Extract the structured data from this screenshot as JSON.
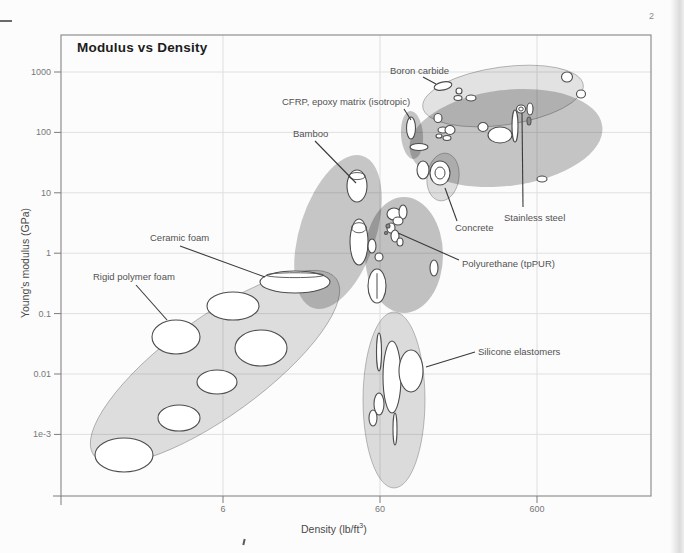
{
  "page": {
    "number": "2"
  },
  "chart_data": {
    "type": "scatter",
    "subtype": "Ashby material property bubble chart",
    "title": "Modulus vs Density",
    "xlabel": "Density (lb/ft3)",
    "xlabel_parts": {
      "prefix": "Density (lb/ft",
      "sup": "3",
      "suffix": ")"
    },
    "ylabel": "Young's modulus (GPa)",
    "x_axis": {
      "scale": "log",
      "ticks": [
        6,
        60,
        600
      ],
      "tick_labels": [
        "6",
        "60",
        "600"
      ],
      "range_approx": [
        0.55,
        3200
      ]
    },
    "y_axis": {
      "scale": "log",
      "ticks": [
        1000,
        100,
        10,
        1,
        0.1,
        0.01,
        0.001
      ],
      "tick_labels": [
        "1000",
        "100",
        "10",
        "1",
        "0.1",
        "0.01",
        "1e-3"
      ],
      "range_approx": [
        0.0001,
        4000
      ]
    },
    "grid": "on",
    "materials_labeled": [
      {
        "label": "Rigid polymer foam",
        "density_lb_ft3": 3,
        "modulus_GPa": 0.04
      },
      {
        "label": "Ceramic foam",
        "density_lb_ft3": 17,
        "modulus_GPa": 0.3
      },
      {
        "label": "Bamboo",
        "density_lb_ft3": 43,
        "modulus_GPa": 13
      },
      {
        "label": "CFRP, epoxy matrix (isotropic)",
        "density_lb_ft3": 95,
        "modulus_GPa": 90
      },
      {
        "label": "Boron carbide",
        "density_lb_ft3": 150,
        "modulus_GPa": 570
      },
      {
        "label": "Concrete",
        "density_lb_ft3": 145,
        "modulus_GPa": 21
      },
      {
        "label": "Stainless steel",
        "density_lb_ft3": 475,
        "modulus_GPa": 240
      },
      {
        "label": "Polyurethane (tpPUR)",
        "density_lb_ft3": 75,
        "modulus_GPa": 3
      },
      {
        "label": "Silicone elastomers",
        "density_lb_ft3": 95,
        "modulus_GPa": 0.011
      }
    ],
    "layout_px": {
      "frame": {
        "left": 61,
        "top": 35,
        "right": 651,
        "bottom": 496
      },
      "x_anchor": {
        "value": 6,
        "px": 223,
        "decade_px": 157
      },
      "y_anchor": {
        "value": 1000,
        "px": 72,
        "decade_px": 60.4
      }
    },
    "regions": [
      {
        "id": "foams-envelope",
        "cx": 215,
        "cy": 367,
        "rx": 150,
        "ry": 49,
        "rot": -36,
        "op": 0.12,
        "outlined": true
      },
      {
        "id": "natural-materials-envelope",
        "cx": 338,
        "cy": 232,
        "rx": 38,
        "ry": 80,
        "rot": 18,
        "op": 0.21,
        "outlined": false
      },
      {
        "id": "polymers-envelope",
        "cx": 404,
        "cy": 255,
        "rx": 39,
        "ry": 58,
        "rot": 0,
        "op": 0.23,
        "outlined": false
      },
      {
        "id": "metals-envelope",
        "cx": 506,
        "cy": 138,
        "rx": 97,
        "ry": 48,
        "rot": -7,
        "op": 0.22,
        "outlined": false
      },
      {
        "id": "ceramics-envelope",
        "cx": 503,
        "cy": 96,
        "rx": 81,
        "ry": 29,
        "rot": -8,
        "op": 0.1,
        "outlined": true
      },
      {
        "id": "composites-envelope",
        "cx": 412,
        "cy": 135,
        "rx": 11,
        "ry": 24,
        "rot": -4,
        "op": 0.22,
        "outlined": false
      },
      {
        "id": "concrete-envelope",
        "cx": 443,
        "cy": 177,
        "rx": 16,
        "ry": 24,
        "rot": 8,
        "op": 0.12,
        "outlined": true
      },
      {
        "id": "elastomers-envelope",
        "cx": 394,
        "cy": 400,
        "rx": 31,
        "ry": 88,
        "rot": 0,
        "op": 0.13,
        "outlined": true
      }
    ],
    "bubbles": [
      {
        "cx": 124,
        "cy": 455,
        "rx": 29,
        "ry": 17
      },
      {
        "cx": 179,
        "cy": 418,
        "rx": 21,
        "ry": 13
      },
      {
        "cx": 217,
        "cy": 382,
        "rx": 20,
        "ry": 12
      },
      {
        "cx": 176,
        "cy": 337,
        "rx": 24,
        "ry": 17
      },
      {
        "cx": 233,
        "cy": 306,
        "rx": 26,
        "ry": 14
      },
      {
        "cx": 261,
        "cy": 348,
        "rx": 26,
        "ry": 18
      },
      {
        "cx": 295,
        "cy": 282,
        "rx": 35,
        "ry": 11,
        "v": "cap"
      },
      {
        "cx": 357,
        "cy": 186,
        "rx": 10,
        "ry": 16,
        "v": "cap"
      },
      {
        "cx": 359,
        "cy": 242,
        "rx": 9,
        "ry": 23,
        "v": "cap"
      },
      {
        "cx": 372,
        "cy": 246,
        "rx": 4,
        "ry": 7
      },
      {
        "cx": 379,
        "cy": 257,
        "rx": 4,
        "ry": 4
      },
      {
        "cx": 377,
        "cy": 286,
        "rx": 9,
        "ry": 17,
        "v": "vline"
      },
      {
        "cx": 394,
        "cy": 214,
        "rx": 7,
        "ry": 6
      },
      {
        "cx": 403,
        "cy": 212,
        "rx": 4,
        "ry": 7
      },
      {
        "cx": 398,
        "cy": 221,
        "rx": 5,
        "ry": 4
      },
      {
        "cx": 391,
        "cy": 228,
        "rx": 4,
        "ry": 5
      },
      {
        "cx": 395,
        "cy": 236,
        "rx": 4,
        "ry": 6
      },
      {
        "cx": 400,
        "cy": 242,
        "rx": 3,
        "ry": 4
      },
      {
        "cx": 388,
        "cy": 226,
        "rx": 2,
        "ry": 2,
        "v": "dark"
      },
      {
        "cx": 386,
        "cy": 233,
        "rx": 1.5,
        "ry": 1.5,
        "v": "dark"
      },
      {
        "cx": 434,
        "cy": 268,
        "rx": 4,
        "ry": 8
      },
      {
        "cx": 419,
        "cy": 147,
        "rx": 9,
        "ry": 3.5
      },
      {
        "cx": 423,
        "cy": 170,
        "rx": 6,
        "ry": 9
      },
      {
        "cx": 440,
        "cy": 173,
        "rx": 10,
        "ry": 12,
        "v": "ring"
      },
      {
        "cx": 443,
        "cy": 86,
        "rx": 9,
        "ry": 4,
        "rot": -12
      },
      {
        "cx": 459,
        "cy": 91,
        "rx": 3,
        "ry": 3
      },
      {
        "cx": 458,
        "cy": 98,
        "rx": 4,
        "ry": 2.5
      },
      {
        "cx": 471,
        "cy": 98,
        "rx": 5,
        "ry": 3
      },
      {
        "cx": 438,
        "cy": 118,
        "rx": 4,
        "ry": 4.5
      },
      {
        "cx": 411,
        "cy": 128,
        "rx": 4.5,
        "ry": 11
      },
      {
        "cx": 443,
        "cy": 130,
        "rx": 5,
        "ry": 3
      },
      {
        "cx": 450,
        "cy": 130,
        "rx": 5,
        "ry": 4.5
      },
      {
        "cx": 439,
        "cy": 136,
        "rx": 3,
        "ry": 2
      },
      {
        "cx": 447,
        "cy": 138,
        "rx": 4,
        "ry": 2.5
      },
      {
        "cx": 483,
        "cy": 127,
        "rx": 5,
        "ry": 4.5
      },
      {
        "cx": 500,
        "cy": 135,
        "rx": 12,
        "ry": 8
      },
      {
        "cx": 515,
        "cy": 126,
        "rx": 3,
        "ry": 16
      },
      {
        "cx": 521,
        "cy": 109,
        "rx": 4.5,
        "ry": 4,
        "v": "ring"
      },
      {
        "cx": 530,
        "cy": 109,
        "rx": 3,
        "ry": 6
      },
      {
        "cx": 529,
        "cy": 121,
        "rx": 2,
        "ry": 4,
        "v": "dark"
      },
      {
        "cx": 542,
        "cy": 179,
        "rx": 5,
        "ry": 3
      },
      {
        "cx": 567,
        "cy": 77,
        "rx": 5.5,
        "ry": 5
      },
      {
        "cx": 581,
        "cy": 94,
        "rx": 4.5,
        "ry": 4
      },
      {
        "cx": 379,
        "cy": 352,
        "rx": 2.5,
        "ry": 19
      },
      {
        "cx": 392,
        "cy": 377,
        "rx": 9,
        "ry": 36
      },
      {
        "cx": 411,
        "cy": 371,
        "rx": 12,
        "ry": 21
      },
      {
        "cx": 379,
        "cy": 404,
        "rx": 5,
        "ry": 11
      },
      {
        "cx": 373,
        "cy": 418,
        "rx": 4,
        "ry": 8
      },
      {
        "cx": 395,
        "cy": 429,
        "rx": 2,
        "ry": 16
      }
    ],
    "annotations": [
      {
        "id": "boron-carbide",
        "text": "Boron carbide",
        "tx": 390,
        "ty": 74,
        "line": [
          423,
          77,
          436,
          84
        ]
      },
      {
        "id": "cfrp",
        "text": "CFRP, epoxy matrix (isotropic)",
        "tx": 282,
        "ty": 105,
        "line": [
          404,
          109,
          411,
          120
        ]
      },
      {
        "id": "bamboo",
        "text": "Bamboo",
        "tx": 293,
        "ty": 137,
        "line": [
          315,
          141,
          356,
          183
        ]
      },
      {
        "id": "ceramic-foam",
        "text": "Ceramic foam",
        "tx": 150,
        "ty": 241,
        "line": [
          180,
          246,
          265,
          277
        ]
      },
      {
        "id": "rigid-polymer-foam",
        "text": "Rigid polymer foam",
        "tx": 93,
        "ty": 280,
        "line": [
          136,
          285,
          167,
          320
        ]
      },
      {
        "id": "concrete",
        "text": "Concrete",
        "tx": 455,
        "ty": 231,
        "line": [
          457,
          221,
          445,
          188
        ]
      },
      {
        "id": "stainless-steel",
        "text": "Stainless steel",
        "tx": 504,
        "ty": 221,
        "line": [
          523,
          207,
          522,
          113
        ]
      },
      {
        "id": "polyurethane",
        "text": "Polyurethane (tpPUR)",
        "tx": 462,
        "ty": 267,
        "line": [
          459,
          260,
          398,
          233
        ]
      },
      {
        "id": "silicone-elastomers",
        "text": "Silicone elastomers",
        "tx": 478,
        "ty": 355,
        "line": [
          475,
          352,
          426,
          367
        ]
      }
    ]
  }
}
